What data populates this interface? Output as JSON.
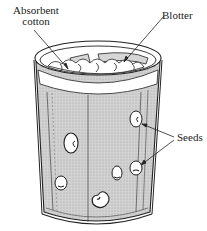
{
  "figure": {
    "labels": {
      "absorbent_line1": "Absorbent",
      "absorbent_line2": "cotton",
      "blotter": "Blotter",
      "seeds": "Seeds"
    },
    "colors": {
      "ink": "#222222",
      "shading": "#c8c8c8",
      "blotter_fill": "#d6d6d6",
      "background": "#ffffff"
    },
    "seed_count": 6
  }
}
